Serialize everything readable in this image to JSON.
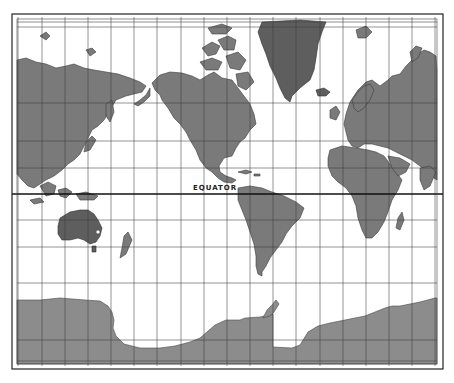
{
  "map": {
    "projection": "Mercator",
    "equator_label": "EQUATOR",
    "colors": {
      "land": "#7a7a7a",
      "land_dark": "#5e5e5e",
      "antarctica": "#8c8c8c",
      "ocean": "#ffffff",
      "grid": "#3a3a3a"
    },
    "meridians_x": [
      18,
      42,
      65,
      88,
      111,
      134,
      157,
      181,
      204,
      227,
      250,
      273,
      296,
      320,
      343,
      366,
      389,
      412,
      435
    ],
    "parallels_y": [
      27,
      103,
      141,
      168,
      220,
      247,
      283,
      340
    ],
    "equator_y": 194
  }
}
